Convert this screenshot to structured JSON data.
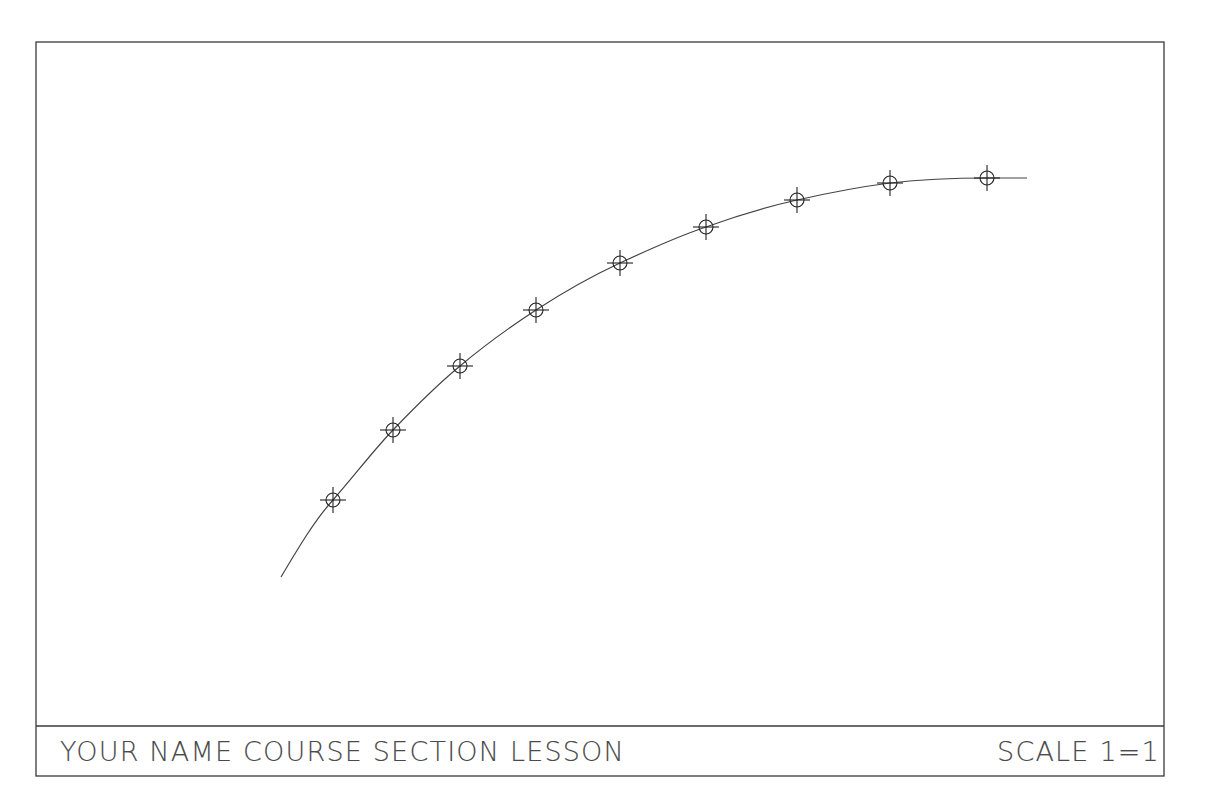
{
  "drawing": {
    "frame": {
      "x1": 36,
      "y1": 42,
      "x2": 1164,
      "y2": 776,
      "title_divider_y": 726
    },
    "curve": {
      "start": [
        281,
        577
      ],
      "end": [
        1027,
        178
      ],
      "path": "M281,577 C300,545 315,520 333,500 C355,475 372,452 393,430 C415,407 437,385 460,366 C485,345 510,327 536,310 C562,293 590,277 620,263 C650,249 676,237 706,227 C736,216 766,207 797,200 C828,193 859,187 890,183 C925,179 955,178 987,178 C1000,178 1013,178 1027,178"
    },
    "markers": [
      {
        "x": 333,
        "y": 500
      },
      {
        "x": 393,
        "y": 430
      },
      {
        "x": 460,
        "y": 366
      },
      {
        "x": 536,
        "y": 310
      },
      {
        "x": 620,
        "y": 263
      },
      {
        "x": 706,
        "y": 227
      },
      {
        "x": 797,
        "y": 200
      },
      {
        "x": 890,
        "y": 183
      },
      {
        "x": 987,
        "y": 178
      }
    ],
    "marker_style": {
      "circle_radius": 7,
      "cross_half_length": 13,
      "symbol": "circle-with-cross"
    }
  },
  "title_block": {
    "left_text": "YOUR NAME COURSE SECTION LESSON",
    "right_text": "SCALE 1=1"
  }
}
